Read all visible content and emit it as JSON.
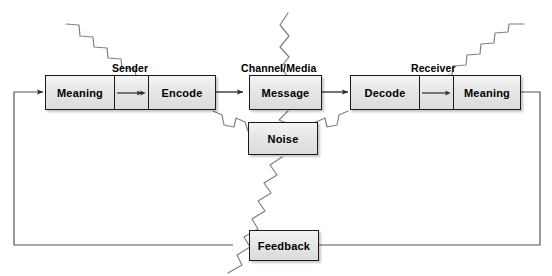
{
  "diagram": {
    "colors": {
      "box_fill_top": "#f4f4f4",
      "box_fill_bottom": "#dcdcdc",
      "border": "#1a1a1a",
      "line": "#3a3a3a",
      "noise_zigzag": "#888888",
      "background": "#ffffff"
    },
    "group_labels": [
      {
        "name": "sender",
        "text": "Sender"
      },
      {
        "name": "channel",
        "text": "Channel/Media"
      },
      {
        "name": "receiver",
        "text": "Receiver"
      }
    ],
    "sender": {
      "label": "Sender",
      "cells": [
        {
          "name": "meaning",
          "text": "Meaning"
        },
        {
          "name": "arrow",
          "text": ""
        },
        {
          "name": "encode",
          "text": "Encode"
        }
      ]
    },
    "channel": {
      "label": "Channel/Media",
      "cells": [
        {
          "name": "message",
          "text": "Message"
        }
      ]
    },
    "receiver": {
      "label": "Receiver",
      "cells": [
        {
          "name": "decode",
          "text": "Decode"
        },
        {
          "name": "arrow",
          "text": ""
        },
        {
          "name": "meaning",
          "text": "Meaning"
        }
      ]
    },
    "noise": {
      "label": "Noise"
    },
    "feedback": {
      "label": "Feedback"
    }
  }
}
